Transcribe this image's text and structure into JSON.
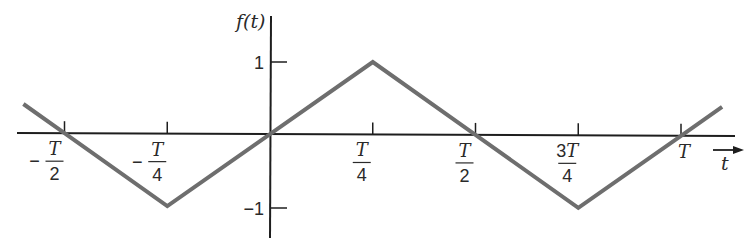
{
  "chart_data": {
    "type": "line",
    "title": "",
    "xlabel": "t",
    "ylabel": "f(t)",
    "x_ticks": [
      {
        "label_num": "T",
        "label_den": "2",
        "sign": "-",
        "value": -0.5
      },
      {
        "label_num": "T",
        "label_den": "4",
        "sign": "-",
        "value": -0.25
      },
      {
        "label_num": "T",
        "label_den": "4",
        "sign": "",
        "value": 0.25
      },
      {
        "label_num": "T",
        "label_den": "2",
        "sign": "",
        "value": 0.5
      },
      {
        "label_num": "3T",
        "label_den": "4",
        "sign": "",
        "value": 0.75
      },
      {
        "label_num": "T",
        "label_den": "",
        "sign": "",
        "value": 1.0
      }
    ],
    "y_ticks": [
      {
        "label": "1",
        "value": 1
      },
      {
        "label": "−1",
        "value": -1
      }
    ],
    "x_unit": "T",
    "xlim": [
      -0.6,
      1.1
    ],
    "ylim": [
      -1.3,
      1.6
    ],
    "series": [
      {
        "name": "f(t) triangle wave",
        "color": "#6e6e6e",
        "x": [
          -0.6,
          -0.5,
          -0.25,
          0,
          0.25,
          0.5,
          0.75,
          1.0,
          1.1
        ],
        "y": [
          0.4,
          0.0,
          -1.0,
          0.0,
          1.0,
          0.0,
          -1.0,
          0.0,
          0.4
        ]
      }
    ],
    "grid": false,
    "legend": null
  },
  "axes": {
    "y_label": "f(t)",
    "x_label": "t"
  }
}
